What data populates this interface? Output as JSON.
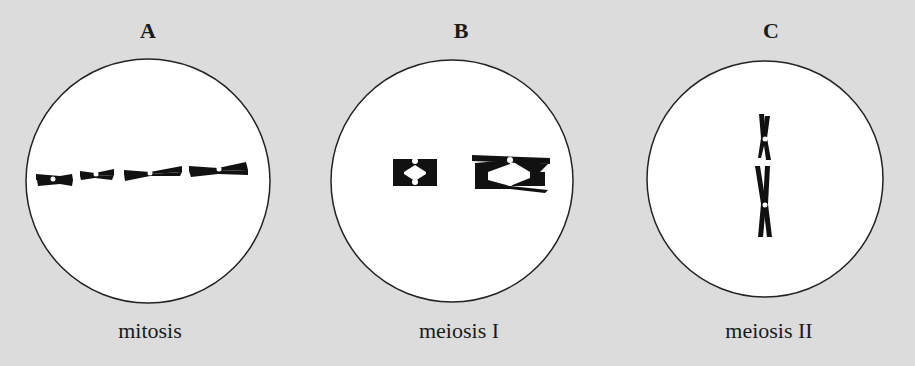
{
  "figure": {
    "background_color": "#dcdcdc",
    "cell_fill": "#ffffff",
    "chromosome_color": "#111111",
    "panels": [
      {
        "letter": "A",
        "caption": "mitosis",
        "description": "Four chromosomes, each with two sister chromatids, aligned individually at the metaphase plate"
      },
      {
        "letter": "B",
        "caption": "meiosis I",
        "description": "Two homologous pairs (tetrads/bivalents) aligned at the metaphase plate with chiasmata"
      },
      {
        "letter": "C",
        "caption": "meiosis II",
        "description": "Two chromosomes, each with two chromatids, aligned vertically at the metaphase plate"
      }
    ]
  }
}
